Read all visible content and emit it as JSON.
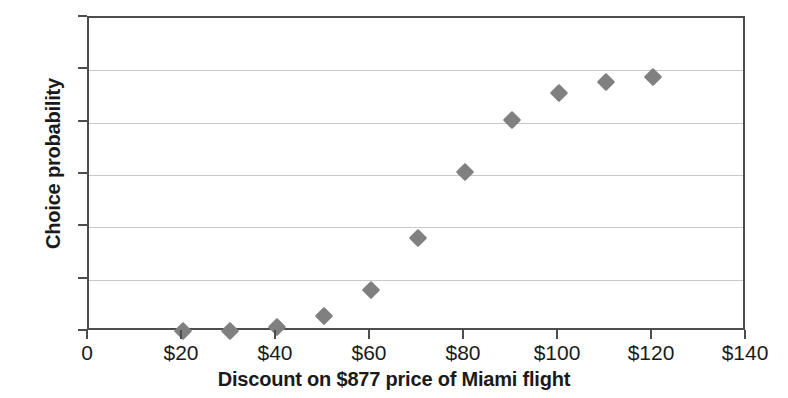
{
  "chart_data": {
    "type": "scatter",
    "title": "",
    "xlabel": "Discount on $877 price of Miami flight",
    "ylabel": "Choice probability",
    "xlim": [
      0,
      140
    ],
    "ylim": [
      0,
      1.2
    ],
    "grid": true,
    "legend": null,
    "marker": "diamond",
    "marker_color": "#808080",
    "axis_color": "#4d4d4d",
    "gridline_color": "#c8c8c8",
    "background_color": "#ffffff",
    "x_tick_labels": [
      "0",
      "$20",
      "$40",
      "$60",
      "$80",
      "$100",
      "$120",
      "$140"
    ],
    "x_ticks": [
      0,
      20,
      40,
      60,
      80,
      100,
      120,
      140
    ],
    "y_tick_labels": [
      "0",
      "0.2",
      "0.4",
      "0.6",
      "0.8",
      "1",
      "1.2"
    ],
    "y_ticks": [
      0,
      0.2,
      0.4,
      0.6,
      0.8,
      1,
      1.2
    ],
    "x": [
      20,
      30,
      40,
      50,
      60,
      70,
      80,
      90,
      100,
      110,
      120
    ],
    "y": [
      0.005,
      0.005,
      0.02,
      0.06,
      0.16,
      0.36,
      0.61,
      0.81,
      0.915,
      0.955,
      0.975
    ],
    "points": [
      {
        "x": 20,
        "y": 0.005
      },
      {
        "x": 30,
        "y": 0.005
      },
      {
        "x": 40,
        "y": 0.02
      },
      {
        "x": 50,
        "y": 0.06
      },
      {
        "x": 60,
        "y": 0.16
      },
      {
        "x": 70,
        "y": 0.36
      },
      {
        "x": 80,
        "y": 0.61
      },
      {
        "x": 90,
        "y": 0.81
      },
      {
        "x": 100,
        "y": 0.915
      },
      {
        "x": 110,
        "y": 0.955
      },
      {
        "x": 120,
        "y": 0.975
      }
    ]
  }
}
